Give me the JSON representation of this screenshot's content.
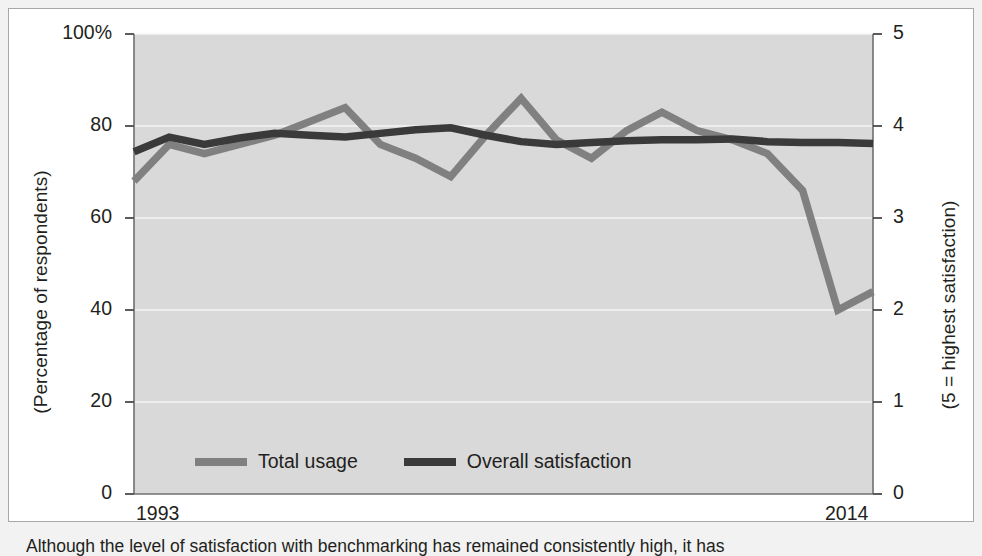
{
  "figure": {
    "caption": "Although the level of satisfaction with benchmarking has remained consistently high, it has",
    "background_color": "#f2f2f2",
    "card_color": "#ffffff",
    "plot_color": "#d9d9d9"
  },
  "chart_data": {
    "type": "line",
    "title": "",
    "xlabel": "",
    "ylabel": "(Percentage of respondents)",
    "ylabel_right": "(5 = highest satisfaction)",
    "x": [
      1993,
      1994,
      1995,
      1996,
      1997,
      1998,
      1999,
      2000,
      2001,
      2002,
      2003,
      2004,
      2005,
      2006,
      2007,
      2008,
      2009,
      2010,
      2011,
      2012,
      2013,
      2014
    ],
    "x_tick_labels": [
      "1993",
      "2014"
    ],
    "x_tick_values": [
      1993,
      2014
    ],
    "xlim": [
      1993,
      2014
    ],
    "ylim": [
      0,
      100
    ],
    "ylim_right": [
      0,
      5
    ],
    "y_ticks": [
      0,
      20,
      40,
      60,
      80,
      100
    ],
    "y_tick_labels": [
      "0",
      "20",
      "40",
      "60",
      "80",
      "100%"
    ],
    "y_ticks_right": [
      0,
      1,
      2,
      3,
      4,
      5
    ],
    "y_tick_labels_right": [
      "0",
      "1",
      "2",
      "3",
      "4",
      "5"
    ],
    "grid": true,
    "legend_position": "inside-bottom-left",
    "series": [
      {
        "name": "Total usage",
        "axis": "left",
        "color": "#808080",
        "units": "percent",
        "values": [
          68,
          76,
          74,
          76,
          78,
          81,
          84,
          76,
          73,
          69,
          78,
          86,
          77,
          73,
          79,
          83,
          79,
          77,
          74,
          66,
          40,
          44
        ]
      },
      {
        "name": "Overall satisfaction",
        "axis": "right",
        "color": "#3a3a3a",
        "units": "rating",
        "values_rating": [
          3.72,
          3.88,
          3.8,
          3.87,
          3.92,
          3.9,
          3.88,
          3.92,
          3.96,
          3.98,
          3.9,
          3.83,
          3.8,
          3.82,
          3.84,
          3.85,
          3.85,
          3.86,
          3.83,
          3.82,
          3.82,
          3.81
        ],
        "values_percent": [
          74.4,
          77.6,
          76.0,
          77.4,
          78.4,
          78.0,
          77.6,
          78.4,
          79.2,
          79.6,
          78.0,
          76.6,
          76.0,
          76.4,
          76.8,
          77.0,
          77.0,
          77.2,
          76.6,
          76.4,
          76.4,
          76.2
        ]
      }
    ]
  },
  "legend": {
    "items": [
      {
        "label": "Total usage",
        "color": "#808080"
      },
      {
        "label": "Overall satisfaction",
        "color": "#3a3a3a"
      }
    ]
  }
}
